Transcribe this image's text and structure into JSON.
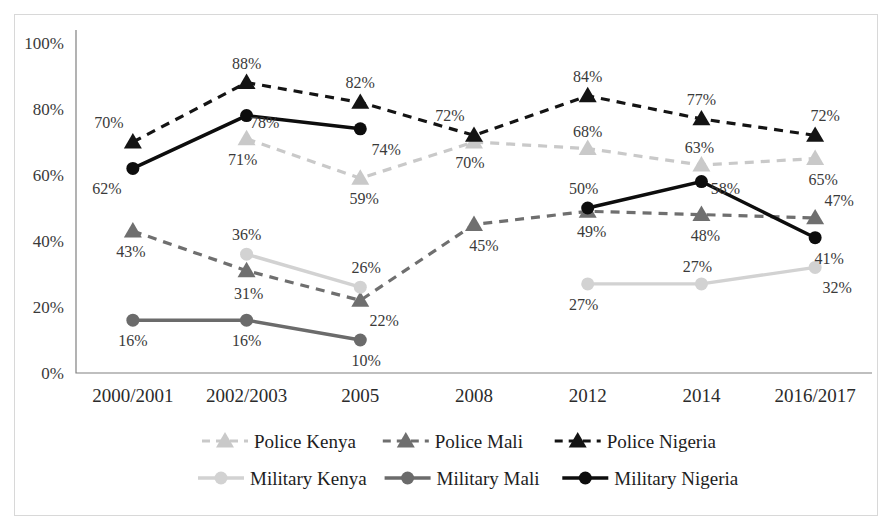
{
  "chart_data": {
    "type": "line",
    "title": "",
    "xlabel": "",
    "ylabel": "",
    "ylim": [
      0,
      100
    ],
    "grid": false,
    "legend_position": "bottom",
    "categories": [
      "2000/2001",
      "2002/2003",
      "2005",
      "2008",
      "2012",
      "2014",
      "2016/2017"
    ],
    "ytick_labels": [
      "0%",
      "20%",
      "40%",
      "60%",
      "80%",
      "100%"
    ],
    "ytick_values": [
      0,
      20,
      40,
      60,
      80,
      100
    ],
    "series": [
      {
        "name": "Police Kenya",
        "color": "#c9c9c9",
        "style": "dashed",
        "marker": "triangle",
        "values": [
          null,
          71,
          59,
          70,
          68,
          63,
          65
        ],
        "labels": [
          "",
          "71%",
          "59%",
          "70%",
          "68%",
          "63%",
          "65%"
        ]
      },
      {
        "name": "Police Mali",
        "color": "#6f6f6f",
        "style": "dashed",
        "marker": "triangle",
        "values": [
          43,
          31,
          22,
          45,
          49,
          48,
          47
        ],
        "labels": [
          "43%",
          "31%",
          "22%",
          "45%",
          "49%",
          "48%",
          "47%"
        ]
      },
      {
        "name": "Police Nigeria",
        "color": "#141414",
        "style": "dashed",
        "marker": "triangle",
        "values": [
          70,
          88,
          82,
          72,
          84,
          77,
          72
        ],
        "labels": [
          "70%",
          "88%",
          "82%",
          "72%",
          "84%",
          "77%",
          "72%"
        ]
      },
      {
        "name": "Military Kenya",
        "color": "#d2d2d2",
        "style": "solid",
        "marker": "circle",
        "values": [
          null,
          36,
          26,
          null,
          27,
          27,
          32
        ],
        "labels": [
          "",
          "36%",
          "26%",
          "",
          "27%",
          "27%",
          "32%"
        ]
      },
      {
        "name": "Military Mali",
        "color": "#6b6b6b",
        "style": "solid",
        "marker": "circle",
        "values": [
          16,
          16,
          10,
          null,
          null,
          null,
          null
        ],
        "labels": [
          "16%",
          "16%",
          "10%",
          "",
          "",
          "",
          ""
        ]
      },
      {
        "name": "Military Nigeria",
        "color": "#0d0d0d",
        "style": "solid",
        "marker": "circle",
        "values": [
          62,
          78,
          74,
          null,
          50,
          58,
          41
        ],
        "labels": [
          "62%",
          "78%",
          "74%",
          "",
          "50%",
          "58%",
          "41%"
        ]
      }
    ],
    "label_offsets": [
      {
        "series": "Police Kenya",
        "dx": [
          0,
          -4,
          4,
          -4,
          0,
          -2,
          8
        ],
        "dy": [
          0,
          26,
          26,
          26,
          -12,
          -12,
          26
        ]
      },
      {
        "series": "Police Mali",
        "dx": [
          -2,
          2,
          24,
          10,
          4,
          4,
          24
        ],
        "dy": [
          26,
          28,
          26,
          26,
          26,
          26,
          -12
        ]
      },
      {
        "series": "Police Nigeria",
        "dx": [
          -24,
          0,
          0,
          -24,
          0,
          0,
          10
        ],
        "dy": [
          -14,
          -14,
          -14,
          -14,
          -14,
          -14,
          -14
        ]
      },
      {
        "series": "Military Kenya",
        "dx": [
          0,
          0,
          6,
          0,
          -4,
          -4,
          22
        ],
        "dy": [
          0,
          -14,
          -14,
          0,
          26,
          -12,
          26
        ]
      },
      {
        "series": "Military Mali",
        "dx": [
          0,
          0,
          6,
          0,
          0,
          0,
          0
        ],
        "dy": [
          26,
          26,
          26,
          0,
          0,
          0,
          0
        ]
      },
      {
        "series": "Military Nigeria",
        "dx": [
          -26,
          18,
          26,
          0,
          -4,
          24,
          14
        ],
        "dy": [
          26,
          12,
          26,
          0,
          -14,
          12,
          26
        ]
      }
    ]
  },
  "legend": {
    "row1": [
      {
        "label": "Police Kenya",
        "color": "#c9c9c9",
        "style": "dashed",
        "marker": "triangle"
      },
      {
        "label": "Police Mali",
        "color": "#6f6f6f",
        "style": "dashed",
        "marker": "triangle"
      },
      {
        "label": "Police Nigeria",
        "color": "#141414",
        "style": "dashed",
        "marker": "triangle"
      }
    ],
    "row2": [
      {
        "label": "Military Kenya",
        "color": "#d2d2d2",
        "style": "solid",
        "marker": "circle"
      },
      {
        "label": "Military Mali",
        "color": "#6b6b6b",
        "style": "solid",
        "marker": "circle"
      },
      {
        "label": "Military Nigeria",
        "color": "#0d0d0d",
        "style": "solid",
        "marker": "circle"
      }
    ]
  }
}
